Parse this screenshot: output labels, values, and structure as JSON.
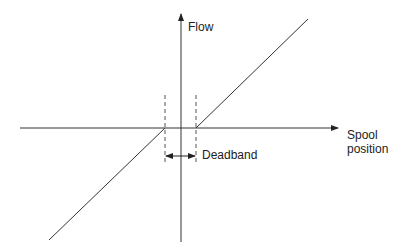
{
  "diagram": {
    "y_axis_label": "Flow",
    "x_axis_label_line1": "Spool",
    "x_axis_label_line2": "position",
    "deadband_label": "Deadband",
    "colors": {
      "line": "#333333",
      "dash": "#555555"
    }
  }
}
